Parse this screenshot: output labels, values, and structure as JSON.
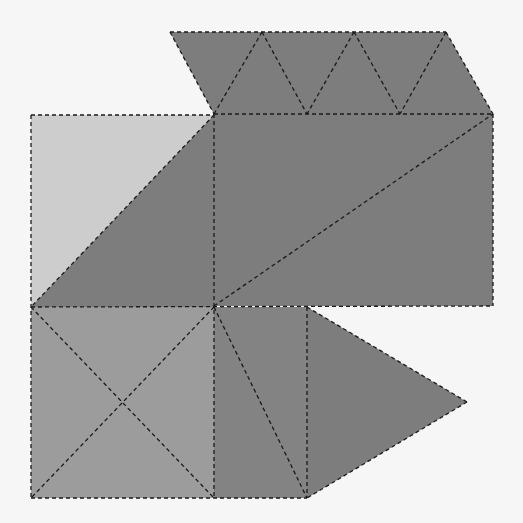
{
  "figure": {
    "type": "polyhedron-net",
    "width": 523,
    "height": 523,
    "background": "#f6f6f6",
    "colors": {
      "light": "#cdcdcd",
      "medium": "#9c9c9c",
      "dark": "#7d7d7d",
      "dark_alt": "#838383",
      "fold_line": "#1a1a1a"
    },
    "faces": [
      {
        "name": "top-parallelogram-strip",
        "tone": "dark",
        "points": [
          [
            170,
            32
          ],
          [
            446,
            32
          ],
          [
            493,
            114
          ],
          [
            214,
            114
          ]
        ]
      },
      {
        "name": "left-square-light-triangle",
        "tone": "light",
        "points": [
          [
            31,
            115
          ],
          [
            214,
            115
          ],
          [
            31,
            307
          ]
        ]
      },
      {
        "name": "left-square-dark-triangle",
        "tone": "dark",
        "points": [
          [
            214,
            115
          ],
          [
            214,
            307
          ],
          [
            31,
            307
          ]
        ]
      },
      {
        "name": "large-rectangle",
        "tone": "dark",
        "points": [
          [
            214,
            114
          ],
          [
            493,
            114
          ],
          [
            493,
            306
          ],
          [
            214,
            306
          ]
        ]
      },
      {
        "name": "bottom-left-square",
        "tone": "medium",
        "points": [
          [
            31,
            307
          ],
          [
            214,
            307
          ],
          [
            214,
            498
          ],
          [
            31,
            498
          ]
        ]
      },
      {
        "name": "bottom-middle-rectangle",
        "tone": "dark_alt",
        "points": [
          [
            214,
            307
          ],
          [
            307,
            307
          ],
          [
            307,
            498
          ],
          [
            214,
            498
          ]
        ]
      },
      {
        "name": "right-triangle-flap",
        "tone": "dark",
        "points": [
          [
            307,
            307
          ],
          [
            467,
            402
          ],
          [
            307,
            498
          ]
        ]
      }
    ],
    "fold_lines": [
      [
        [
          170,
          32
        ],
        [
          446,
          32
        ]
      ],
      [
        [
          446,
          32
        ],
        [
          493,
          114
        ]
      ],
      [
        [
          170,
          32
        ],
        [
          214,
          114
        ]
      ],
      [
        [
          262,
          32
        ],
        [
          214,
          114
        ]
      ],
      [
        [
          262,
          32
        ],
        [
          307,
          114
        ]
      ],
      [
        [
          354,
          32
        ],
        [
          307,
          114
        ]
      ],
      [
        [
          354,
          32
        ],
        [
          400,
          114
        ]
      ],
      [
        [
          446,
          32
        ],
        [
          400,
          114
        ]
      ],
      [
        [
          31,
          115
        ],
        [
          214,
          115
        ]
      ],
      [
        [
          31,
          115
        ],
        [
          31,
          498
        ]
      ],
      [
        [
          214,
          114
        ],
        [
          493,
          114
        ]
      ],
      [
        [
          493,
          114
        ],
        [
          493,
          306
        ]
      ],
      [
        [
          214,
          114
        ],
        [
          214,
          498
        ]
      ],
      [
        [
          214,
          115
        ],
        [
          31,
          307
        ]
      ],
      [
        [
          214,
          306
        ],
        [
          493,
          114
        ]
      ],
      [
        [
          31,
          307
        ],
        [
          493,
          306
        ]
      ],
      [
        [
          31,
          307
        ],
        [
          214,
          498
        ]
      ],
      [
        [
          214,
          307
        ],
        [
          31,
          498
        ]
      ],
      [
        [
          31,
          498
        ],
        [
          307,
          498
        ]
      ],
      [
        [
          214,
          307
        ],
        [
          307,
          498
        ]
      ],
      [
        [
          307,
          307
        ],
        [
          307,
          498
        ]
      ],
      [
        [
          307,
          307
        ],
        [
          467,
          402
        ]
      ],
      [
        [
          467,
          402
        ],
        [
          307,
          498
        ]
      ]
    ]
  }
}
